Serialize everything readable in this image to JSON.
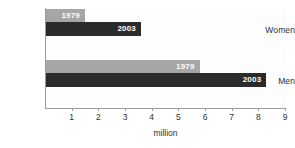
{
  "chart_data": {
    "type": "bar",
    "orientation": "horizontal",
    "title": "",
    "xlabel": "million",
    "ylabel": "",
    "categories": [
      "Women",
      "Men"
    ],
    "series": [
      {
        "name": "1979",
        "values": [
          1.5,
          5.8
        ],
        "color": "#a6a6a6"
      },
      {
        "name": "2003",
        "values": [
          3.6,
          8.3
        ],
        "color": "#2b2b2b"
      }
    ],
    "xlim": [
      0,
      9
    ],
    "xticks": [
      1,
      2,
      3,
      4,
      5,
      6,
      7,
      8,
      9
    ],
    "xtick_labels": [
      "1",
      "2",
      "3",
      "4",
      "5",
      "6",
      "7",
      "8",
      "9"
    ],
    "grid": false,
    "legend": "none (bars labeled in place)",
    "bar_labels": {
      "women_1979": "1979",
      "women_2003": "2003",
      "men_1979": "1979",
      "men_2003": "2003"
    }
  },
  "colors": {
    "series_1979": "#a6a6a6",
    "series_2003": "#2b2b2b",
    "axis": "#9a9a9a",
    "text": "#2f2f2f",
    "plot_background": "#fdfdfd",
    "page_background": "#ffffff"
  }
}
